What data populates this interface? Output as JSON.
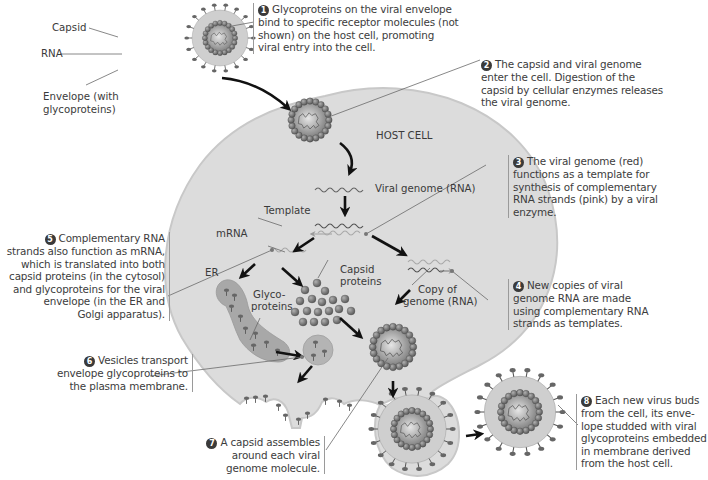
{
  "diagram": {
    "type": "biological-process",
    "host_cell_label": "HOST CELL",
    "virion_labels": {
      "capsid": "Capsid",
      "rna": "RNA",
      "envelope_line1": "Envelope (with",
      "envelope_line2": "glycoproteins)"
    },
    "inner_labels": {
      "viral_genome": "Viral genome (RNA)",
      "template": "Template",
      "mrna": "mRNA",
      "er": "ER",
      "glyco_line1": "Glyco-",
      "glyco_line2": "proteins",
      "capsid_proteins_line1": "Capsid",
      "capsid_proteins_line2": "proteins",
      "copy_line1": "Copy of",
      "copy_line2": "genome (RNA)"
    },
    "steps": [
      {
        "number": "1",
        "lines": [
          "Glycoproteins on the viral envelope",
          "bind to specific receptor molecules (not",
          "shown) on the host cell, promoting",
          "viral entry into the cell."
        ]
      },
      {
        "number": "2",
        "lines": [
          "The capsid and viral genome",
          "enter the cell. Digestion of the",
          "capsid by cellular enzymes releases",
          "the viral genome."
        ]
      },
      {
        "number": "3",
        "lines": [
          "The viral genome (red)",
          "functions as a template for",
          "synthesis of complementary",
          "RNA strands (pink) by a viral",
          "enzyme."
        ]
      },
      {
        "number": "4",
        "lines": [
          "New copies of viral",
          "genome RNA are made",
          "using complementary RNA",
          "strands as templates."
        ]
      },
      {
        "number": "5",
        "lines": [
          "Complementary RNA",
          "strands also function as mRNA,",
          "which is translated into both",
          "capsid proteins (in the cytosol)",
          "and glycoproteins for the viral",
          "envelope (in the ER and",
          "Golgi apparatus)."
        ]
      },
      {
        "number": "6",
        "lines": [
          "Vesicles transport",
          "envelope glycoproteins to",
          "the plasma membrane."
        ]
      },
      {
        "number": "7",
        "lines": [
          "A capsid assembles",
          "around each viral",
          "genome molecule."
        ]
      },
      {
        "number": "8",
        "lines": [
          "Each new virus buds",
          "from the cell, its enve-",
          "lope studded with viral",
          "glycoproteins embedded",
          "in membrane derived",
          "from the host cell."
        ]
      }
    ],
    "colors": {
      "cell_fill": "#dcdcdc",
      "cell_edge": "#c4c4c4",
      "text": "#3a3a3a",
      "arrow": "#111111",
      "leader": "#6a6a6a",
      "capsomere": "#6e6e6e",
      "envelope_fill": "#cfcfcf",
      "er_fill": "#a8a8a8"
    }
  }
}
